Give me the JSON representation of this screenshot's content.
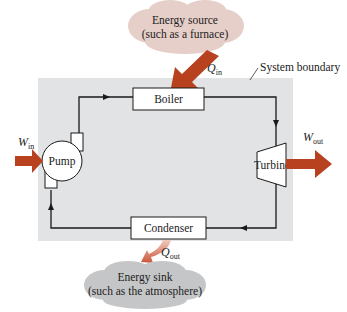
{
  "diagram": {
    "system_boundary_label": "System boundary",
    "source": {
      "line1": "Energy source",
      "line2": "(such as a furnace)"
    },
    "sink": {
      "line1": "Energy sink",
      "line2": "(such as the atmosphere)"
    },
    "components": {
      "boiler": "Boiler",
      "turbine": "Turbine",
      "condenser": "Condenser",
      "pump": "Pump"
    },
    "flows": {
      "q_in": {
        "sym": "Q",
        "sub": "in"
      },
      "q_out": {
        "sym": "Q",
        "sub": "out"
      },
      "w_in": {
        "sym": "W",
        "sub": "in"
      },
      "w_out": {
        "sym": "W",
        "sub": "out"
      }
    },
    "colors": {
      "boundary_fill": "#e2e3e4",
      "arrow": "#b8411f",
      "source_cloud": "#e6cfc8",
      "sink_cloud": "#c5c6c7",
      "line": "#1a1a1a"
    }
  }
}
